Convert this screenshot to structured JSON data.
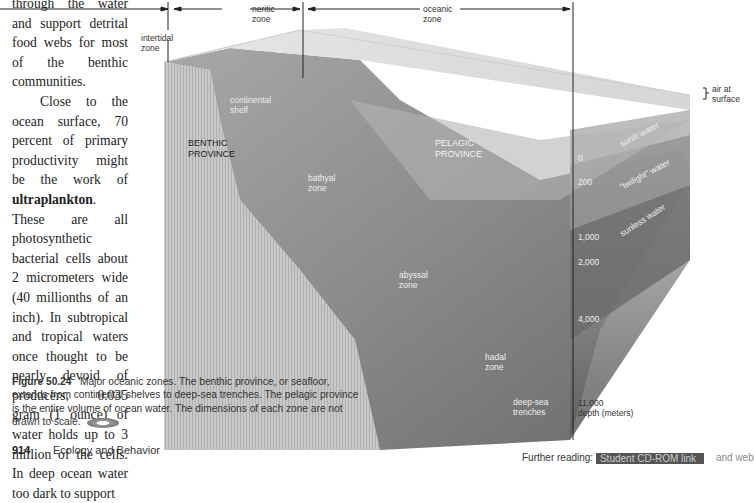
{
  "body_text": {
    "para1_lines": "through the water and support detrital food webs for most of the benthic communities.",
    "para2_pre": "Close to the ocean surface, 70 percent of primary productivity might be the work of ",
    "para2_bold": "ultraplankton",
    "para2_post": ". These are all photosynthetic bacterial cells about 2 micrometers wide (40 millionths of an inch). In subtropical and tropical waters once thought to be nearly devoid of producers, 0.035 gram (1 ounce) of water holds up to 3 million of the cells. In deep ocean water too dark to support"
  },
  "diagram": {
    "top_labels": {
      "neritic": [
        "neritic",
        "zone"
      ],
      "oceanic": [
        "oceanic",
        "zone"
      ],
      "intertidal": [
        "intertidal",
        "zone"
      ]
    },
    "air_at_surface": [
      "air at",
      "surface"
    ],
    "continental_shelf": [
      "continental",
      "shelf"
    ],
    "benthic_province": [
      "BENTHIC",
      "PROVINCE"
    ],
    "pelagic_province": [
      "PELAGIC",
      "PROVINCE"
    ],
    "bathyal": [
      "bathyal",
      "zone"
    ],
    "abyssal": [
      "abyssal",
      "zone"
    ],
    "hadal": [
      "hadal",
      "zone"
    ],
    "trenches": [
      "deep-sea",
      "trenches"
    ],
    "water_layers": [
      "sunlit water",
      "\"twilight\" water",
      "sunless water"
    ],
    "depths": [
      "0",
      "200",
      "1,000",
      "2,000",
      "4,000",
      "11,000"
    ],
    "depth_unit": "depth (meters)"
  },
  "caption": {
    "figure_label": "Figure 50.24",
    "text": "Major oceanic zones. The benthic province, or seafloor, extends from continental shelves to deep-sea trenches. The pelagic province is the entire volume of ocean water. The dimensions of each zone are not drawn to scale.",
    "icon": "cd-rom-icon"
  },
  "footer": {
    "page_number": "914",
    "section": "Ecology and Behavior",
    "further_reading_label": "Further reading:",
    "further_reading_box": "Student CD-ROM link",
    "further_reading_tail": "and web"
  }
}
